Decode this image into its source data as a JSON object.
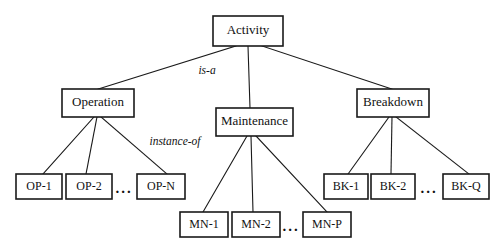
{
  "diagram": {
    "background_color": "#ffffff",
    "stroke_color": "#1a1a1a",
    "text_color": "#111111",
    "root": {
      "id": "activity",
      "label": "Activity",
      "x": 213,
      "y": 16,
      "w": 70,
      "h": 30
    },
    "classes": [
      {
        "id": "operation",
        "label": "Operation",
        "x": 62,
        "y": 89,
        "w": 72,
        "h": 28
      },
      {
        "id": "maintenance",
        "label": "Maintenance",
        "x": 216,
        "y": 108,
        "w": 77,
        "h": 28
      },
      {
        "id": "breakdown",
        "label": "Breakdown",
        "x": 357,
        "y": 89,
        "w": 72,
        "h": 28
      }
    ],
    "instances": [
      {
        "id": "op-1",
        "parent": "operation",
        "label": "OP-1",
        "x": 16,
        "y": 174,
        "w": 46,
        "h": 25
      },
      {
        "id": "op-2",
        "parent": "operation",
        "label": "OP-2",
        "x": 66,
        "y": 174,
        "w": 46,
        "h": 25
      },
      {
        "id": "op-n",
        "parent": "operation",
        "label": "OP-N",
        "x": 137,
        "y": 174,
        "w": 48,
        "h": 25
      },
      {
        "id": "bk-1",
        "parent": "breakdown",
        "label": "BK-1",
        "x": 324,
        "y": 174,
        "w": 44,
        "h": 25
      },
      {
        "id": "bk-2",
        "parent": "breakdown",
        "label": "BK-2",
        "x": 371,
        "y": 174,
        "w": 44,
        "h": 25
      },
      {
        "id": "bk-q",
        "parent": "breakdown",
        "label": "BK-Q",
        "x": 443,
        "y": 174,
        "w": 46,
        "h": 25
      },
      {
        "id": "mn-1",
        "parent": "maintenance",
        "label": "MN-1",
        "x": 180,
        "y": 212,
        "w": 48,
        "h": 25
      },
      {
        "id": "mn-2",
        "parent": "maintenance",
        "label": "MN-2",
        "x": 232,
        "y": 212,
        "w": 48,
        "h": 25
      },
      {
        "id": "mn-p",
        "parent": "maintenance",
        "label": "MN-P",
        "x": 303,
        "y": 212,
        "w": 48,
        "h": 25
      }
    ],
    "ellipses": [
      {
        "id": "op-ellipsis",
        "label": "...",
        "x": 124,
        "y": 190
      },
      {
        "id": "bk-ellipsis",
        "label": "...",
        "x": 429,
        "y": 190
      },
      {
        "id": "mn-ellipsis",
        "label": "...",
        "x": 291,
        "y": 228
      }
    ],
    "edge_labels": [
      {
        "id": "is-a",
        "label": "is-a",
        "x": 207,
        "y": 71
      },
      {
        "id": "instance-of",
        "label": "instance-of",
        "x": 175,
        "y": 142
      }
    ],
    "edges": [
      {
        "id": "activity-operation",
        "x1": 236,
        "y1": 46,
        "x2": 98,
        "y2": 89
      },
      {
        "id": "activity-maintenance",
        "x1": 248,
        "y1": 46,
        "x2": 250,
        "y2": 108
      },
      {
        "id": "activity-breakdown",
        "x1": 262,
        "y1": 46,
        "x2": 392,
        "y2": 89
      },
      {
        "id": "operation-op1",
        "x1": 94,
        "y1": 117,
        "x2": 43,
        "y2": 174
      },
      {
        "id": "operation-op2",
        "x1": 97,
        "y1": 117,
        "x2": 86,
        "y2": 174
      },
      {
        "id": "operation-opn",
        "x1": 101,
        "y1": 117,
        "x2": 167,
        "y2": 174
      },
      {
        "id": "breakdown-bk1",
        "x1": 389,
        "y1": 117,
        "x2": 348,
        "y2": 174
      },
      {
        "id": "breakdown-bk2",
        "x1": 392,
        "y1": 117,
        "x2": 391,
        "y2": 174
      },
      {
        "id": "breakdown-bkq",
        "x1": 396,
        "y1": 117,
        "x2": 469,
        "y2": 174
      },
      {
        "id": "maintenance-mn1",
        "x1": 247,
        "y1": 136,
        "x2": 203,
        "y2": 212
      },
      {
        "id": "maintenance-mn2",
        "x1": 251,
        "y1": 136,
        "x2": 253,
        "y2": 212
      },
      {
        "id": "maintenance-mnp",
        "x1": 256,
        "y1": 136,
        "x2": 327,
        "y2": 212
      }
    ]
  }
}
